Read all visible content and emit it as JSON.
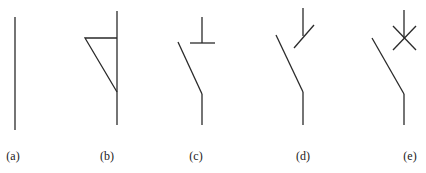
{
  "figure": {
    "type": "switch-contact-symbols",
    "line_color": "#2a2a2a",
    "symbols": [
      {
        "id": "a",
        "label": "(a)",
        "description": "plain conductor (vertical line)"
      },
      {
        "id": "b",
        "label": "(b)",
        "description": "vertical line with triangular flag"
      },
      {
        "id": "c",
        "label": "(c)",
        "description": "open switch contact with T-shaped (bar) fixed contact"
      },
      {
        "id": "d",
        "label": "(d)",
        "description": "open switch contact with slash marker on fixed contact"
      },
      {
        "id": "e",
        "label": "(e)",
        "description": "open switch contact with X (cross) marker on fixed contact"
      }
    ]
  }
}
